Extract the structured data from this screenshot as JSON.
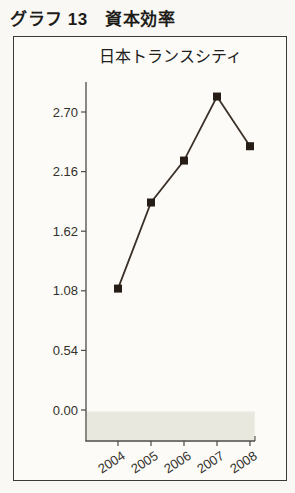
{
  "page": {
    "title": "グラフ 13　資本効率"
  },
  "panel": {
    "subtitle": "日本トランスシティ"
  },
  "chart_data": {
    "type": "line",
    "title": "日本トランスシティ",
    "categories": [
      "2004",
      "2005",
      "2006",
      "2007",
      "2008"
    ],
    "values": [
      1.1,
      1.88,
      2.26,
      2.84,
      2.39
    ],
    "series": [
      {
        "name": "日本トランスシティ",
        "values": [
          1.1,
          1.88,
          2.26,
          2.84,
          2.39
        ]
      }
    ],
    "yticks": [
      0.0,
      0.54,
      1.08,
      1.62,
      2.16,
      2.7
    ],
    "ylim": [
      -0.28,
      2.97
    ],
    "xlabel": "",
    "ylabel": "",
    "grid": false,
    "legend": "none",
    "marker": "filled-square",
    "x_label_rotation_deg": -33,
    "colors": {
      "line": "#3b3129",
      "marker": "#261d16",
      "axis": "#4c4a44",
      "tick_label": "#33312c",
      "negative_band": "#e9e8de"
    }
  }
}
